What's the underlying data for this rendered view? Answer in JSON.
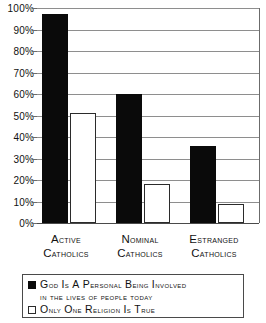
{
  "chart_data": {
    "type": "bar",
    "title": "",
    "subtitle": "",
    "xlabel": "",
    "ylabel": "",
    "ylim": [
      0,
      100
    ],
    "grid": true,
    "legend_position": "bottom",
    "categories": [
      "Active Catholics",
      "Nominal Catholics",
      "Estranged Catholics"
    ],
    "category_lines": [
      [
        "Active",
        "Catholics"
      ],
      [
        "Nominal",
        "Catholics"
      ],
      [
        "Estranged",
        "Catholics"
      ]
    ],
    "series": [
      {
        "name": "God is a personal being involved in the lives of people today",
        "values": [
          97,
          60,
          36
        ],
        "color": "#0a0a0a",
        "style": "filled"
      },
      {
        "name": "Only one religion is true",
        "values": [
          51,
          18,
          9
        ],
        "color": "#ffffff",
        "style": "hollow"
      }
    ],
    "ytick_values": [
      0,
      10,
      20,
      30,
      40,
      50,
      60,
      70,
      80,
      90,
      100
    ],
    "ytick_labels": [
      "0%",
      "10%",
      "20%",
      "30%",
      "40%",
      "50%",
      "60%",
      "70%",
      "80%",
      "90%",
      "100%"
    ]
  },
  "legend": {
    "entries": [
      {
        "line1": "God is a personal being involved",
        "line2": "in the lives of people today",
        "swatch": "filled-square-icon"
      },
      {
        "line1": "Only one religion is true",
        "line2": "",
        "swatch": "hollow-square-icon"
      }
    ]
  }
}
